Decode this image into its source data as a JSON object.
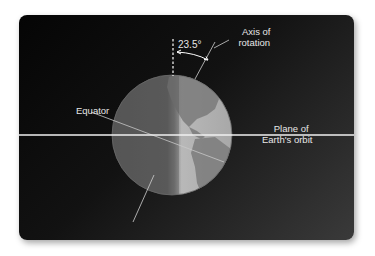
{
  "diagram": {
    "labels": {
      "angle": "23.5°",
      "axis_line1": "Axis of",
      "axis_line2": "rotation",
      "equator": "Equator",
      "plane_line1": "Plane of",
      "plane_line2": "Earth's orbit"
    },
    "tilt_degrees": 23.5,
    "colors": {
      "background_dark": "#050505",
      "background_light": "#3a3a3a",
      "globe_night": "#5a5a5a",
      "globe_day": "#bdbdbd",
      "land_day": "#8a8a8a",
      "orbit_line": "#f0f0f0",
      "label_text": "#e6e6e6"
    }
  }
}
